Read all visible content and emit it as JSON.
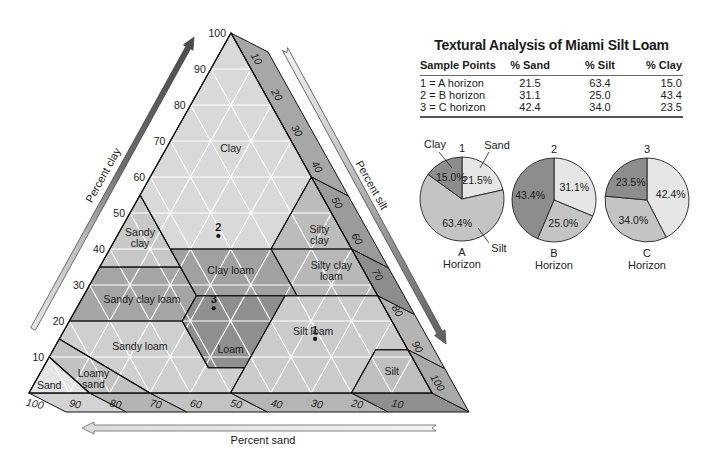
{
  "chart_data": [
    {
      "type": "scatter",
      "coordinate_system": "ternary",
      "component_order": [
        "sand",
        "silt",
        "clay"
      ],
      "axes": {
        "clay": {
          "label": "Percent clay",
          "range": [
            0,
            100
          ],
          "ticks": [
            10,
            20,
            30,
            40,
            50,
            60,
            70,
            80,
            90,
            100
          ]
        },
        "silt": {
          "label": "Percent silt",
          "range": [
            0,
            100
          ],
          "ticks": [
            10,
            20,
            30,
            40,
            50,
            60,
            70,
            80,
            90,
            100
          ]
        },
        "sand": {
          "label": "Percent sand",
          "range": [
            0,
            100
          ],
          "ticks": [
            100,
            90,
            80,
            70,
            60,
            50,
            40,
            30,
            20,
            10
          ]
        }
      },
      "grid": true,
      "grid_step": 10,
      "regions": [
        {
          "name": "Clay",
          "label_lines": [
            "Clay"
          ],
          "label_pos": [
            16,
            16,
            68
          ],
          "fill": "#d9d9d9",
          "vertices": [
            [
              0,
              0,
              100
            ],
            [
              45,
              0,
              55
            ],
            [
              45,
              15,
              40
            ],
            [
              20,
              40,
              40
            ],
            [
              0,
              40,
              60
            ]
          ]
        },
        {
          "name": "Sandy clay",
          "label_lines": [
            "Sandy",
            "clay"
          ],
          "label_pos": [
            51,
            6,
            43
          ],
          "fill": "#c8c8c8",
          "vertices": [
            [
              45,
              0,
              55
            ],
            [
              65,
              0,
              35
            ],
            [
              45,
              20,
              35
            ]
          ]
        },
        {
          "name": "Silty clay",
          "label_lines": [
            "Silty",
            "clay"
          ],
          "label_pos": [
            6,
            50,
            44
          ],
          "fill": "#bcbcbc",
          "vertices": [
            [
              0,
              40,
              60
            ],
            [
              20,
              40,
              40
            ],
            [
              0,
              60,
              40
            ]
          ]
        },
        {
          "name": "Silty clay loam",
          "label_lines": [
            "Silty clay",
            "loam"
          ],
          "label_pos": [
            8,
            58,
            34
          ],
          "fill": "#b8b8b8",
          "vertices": [
            [
              20,
              40,
              40
            ],
            [
              20,
              53,
              27
            ],
            [
              0,
              73,
              27
            ],
            [
              0,
              60,
              40
            ]
          ]
        },
        {
          "name": "Clay loam",
          "label_lines": [
            "Clay loam"
          ],
          "label_pos": [
            33,
            33,
            34
          ],
          "fill": "#a1a1a1",
          "vertices": [
            [
              45,
              15,
              40
            ],
            [
              45,
              28,
              27
            ],
            [
              20,
              53,
              27
            ],
            [
              20,
              40,
              40
            ]
          ]
        },
        {
          "name": "Sandy clay loam",
          "label_lines": [
            "Sandy clay loam"
          ],
          "label_pos": [
            59,
            15,
            26
          ],
          "fill": "#a5a5a5",
          "vertices": [
            [
              65,
              0,
              35
            ],
            [
              80,
              0,
              20
            ],
            [
              52,
              28,
              20
            ],
            [
              45,
              28,
              27
            ],
            [
              45,
              20,
              35
            ]
          ]
        },
        {
          "name": "Loam",
          "label_lines": [
            "Loam"
          ],
          "label_pos": [
            44,
            44,
            12
          ],
          "fill": "#8f8f8f",
          "vertices": [
            [
              45,
              28,
              27
            ],
            [
              52,
              28,
              20
            ],
            [
              52,
              41,
              7
            ],
            [
              43,
              50,
              7
            ],
            [
              23,
              50,
              27
            ]
          ]
        },
        {
          "name": "Silt loam",
          "label_lines": [
            "Silt loam"
          ],
          "label_pos": [
            21,
            62,
            17
          ],
          "fill": "#cbcbcb",
          "vertices": [
            [
              23,
              50,
              27
            ],
            [
              43,
              50,
              7
            ],
            [
              50,
              50,
              0
            ],
            [
              20,
              80,
              0
            ],
            [
              8,
              80,
              12
            ],
            [
              0,
              88,
              12
            ],
            [
              0,
              73,
              27
            ]
          ]
        },
        {
          "name": "Silt",
          "label_lines": [
            "Silt"
          ],
          "label_pos": [
            7,
            87,
            6
          ],
          "fill": "#bfbfbf",
          "vertices": [
            [
              8,
              80,
              12
            ],
            [
              20,
              80,
              0
            ],
            [
              0,
              100,
              0
            ],
            [
              0,
              88,
              12
            ]
          ]
        },
        {
          "name": "Sandy loam",
          "label_lines": [
            "Sandy loam"
          ],
          "label_pos": [
            66,
            21,
            13
          ],
          "fill": "#cfcfcf",
          "vertices": [
            [
              80,
              0,
              20
            ],
            [
              85,
              0,
              15
            ],
            [
              70,
              30,
              0
            ],
            [
              50,
              50,
              0
            ],
            [
              43,
              50,
              7
            ],
            [
              52,
              41,
              7
            ],
            [
              52,
              28,
              20
            ]
          ]
        },
        {
          "name": "Loamy sand",
          "label_lines": [
            "Loamy",
            "sand"
          ],
          "label_pos": [
            82,
            14,
            4
          ],
          "fill": "#c2c2c2",
          "vertices": [
            [
              85,
              0,
              15
            ],
            [
              90,
              0,
              10
            ],
            [
              85,
              15,
              0
            ],
            [
              70,
              30,
              0
            ]
          ]
        },
        {
          "name": "Sand",
          "label_lines": [
            "Sand"
          ],
          "label_pos": [
            94,
            4,
            2
          ],
          "fill": "#e5e5e5",
          "vertices": [
            [
              90,
              0,
              10
            ],
            [
              100,
              0,
              0
            ],
            [
              85,
              15,
              0
            ]
          ]
        }
      ],
      "bands": {
        "bottom": [
          {
            "from": 100,
            "to": 85,
            "fill": "#d3d3d3"
          },
          {
            "from": 85,
            "to": 70,
            "fill": "#b4b4b4"
          },
          {
            "from": 70,
            "to": 50,
            "fill": "#c3c3c3"
          },
          {
            "from": 50,
            "to": 20,
            "fill": "#b5b5b5"
          },
          {
            "from": 20,
            "to": 0,
            "fill": "#8f8f8f"
          }
        ],
        "right": [
          {
            "from": 0,
            "to": 40,
            "fill": "#a7a7a7"
          },
          {
            "from": 40,
            "to": 60,
            "fill": "#9b9b9b"
          },
          {
            "from": 60,
            "to": 73,
            "fill": "#8d8d8d"
          },
          {
            "from": 73,
            "to": 88,
            "fill": "#b4b4b4"
          },
          {
            "from": 88,
            "to": 100,
            "fill": "#a9a9a9"
          }
        ]
      },
      "points": [
        {
          "label": "1",
          "sand": 21.5,
          "silt": 63.4,
          "clay": 15.0
        },
        {
          "label": "2",
          "sand": 31.1,
          "silt": 25.0,
          "clay": 43.4
        },
        {
          "label": "3",
          "sand": 42.4,
          "silt": 34.0,
          "clay": 23.5
        }
      ]
    },
    {
      "type": "pie",
      "title": "1",
      "subtitle_lines": [
        "A",
        "Horizon"
      ],
      "categories": [
        "Sand",
        "Silt",
        "Clay"
      ],
      "values": [
        21.5,
        63.4,
        15.0
      ],
      "labels": [
        "21.5%",
        "63.4%",
        "15.0%"
      ],
      "colors": [
        "#e6e6e6",
        "#c4c4c4",
        "#8d8d8d"
      ],
      "callouts": [
        "Sand",
        "Silt",
        "Clay"
      ]
    },
    {
      "type": "pie",
      "title": "2",
      "subtitle_lines": [
        "B",
        "Horizon"
      ],
      "categories": [
        "Sand",
        "Silt",
        "Clay"
      ],
      "values": [
        31.1,
        25.0,
        43.4
      ],
      "labels": [
        "31.1%",
        "25.0%",
        "43.4%"
      ],
      "colors": [
        "#e6e6e6",
        "#c4c4c4",
        "#8d8d8d"
      ]
    },
    {
      "type": "pie",
      "title": "3",
      "subtitle_lines": [
        "C",
        "Horizon"
      ],
      "categories": [
        "Sand",
        "Silt",
        "Clay"
      ],
      "values": [
        42.4,
        34.0,
        23.5
      ],
      "labels": [
        "42.4%",
        "34.0%",
        "23.5%"
      ],
      "colors": [
        "#e6e6e6",
        "#c4c4c4",
        "#8d8d8d"
      ]
    },
    {
      "type": "table",
      "title": "Textural Analysis of Miami Silt Loam",
      "headers": [
        "Sample Points",
        "% Sand",
        "% Silt",
        "% Clay"
      ],
      "rows": [
        [
          "1 = A horizon",
          "21.5",
          "63.4",
          "15.0"
        ],
        [
          "2 = B horizon",
          "31.1",
          "25.0",
          "43.4"
        ],
        [
          "3 = C horizon",
          "42.4",
          "34.0",
          "23.5"
        ]
      ]
    }
  ]
}
